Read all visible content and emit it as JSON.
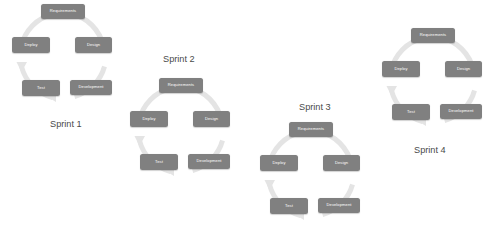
{
  "diagram": {
    "background_color": "#ffffff",
    "node_color": "#808080",
    "node_text_color": "#ffffff",
    "ring_color": "#e4e4e4",
    "label_color": "#4a4a4a",
    "stage_names": {
      "requirements": "Requirements",
      "design": "Design",
      "development": "Development",
      "test": "Test",
      "deploy": "Deploy"
    },
    "cycles": [
      {
        "id": "sprint-1",
        "label": "Sprint 1",
        "stages": {
          "requirements": "Requirements",
          "design": "Design",
          "development": "Development",
          "test": "Test",
          "deploy": "Deploy"
        }
      },
      {
        "id": "sprint-2",
        "label": "Sprint 2",
        "stages": {
          "requirements": "Requirements",
          "design": "Design",
          "development": "Development",
          "test": "Test",
          "deploy": "Deploy"
        }
      },
      {
        "id": "sprint-3",
        "label": "Sprint 3",
        "stages": {
          "requirements": "Requirements",
          "design": "Design",
          "development": "Development",
          "test": "Test",
          "deploy": "Deploy"
        }
      },
      {
        "id": "sprint-4",
        "label": "Sprint 4",
        "stages": {
          "requirements": "Requirements",
          "design": "Design",
          "development": "Development",
          "test": "Test",
          "deploy": "Deploy"
        }
      }
    ]
  }
}
